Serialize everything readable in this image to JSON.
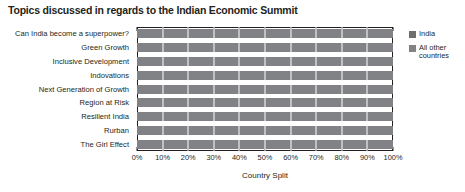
{
  "chart_data": {
    "type": "bar",
    "subtype": "stacked-horizontal-100-percent",
    "title": "Topics discussed in regards to the Indian Economic Summit",
    "xlabel": "Country Split",
    "ylabel": "",
    "xlim": [
      0,
      100
    ],
    "grid": true,
    "grid_axis": "x",
    "legend_position": "right",
    "orientation": "horizontal",
    "categories": [
      "Can India become a superpower?",
      "Green Growth",
      "Inclusive Development",
      "Indovations",
      "Next Generation of Growth",
      "Region at Risk",
      "Resilient India",
      "Rurban",
      "The Girl Effect"
    ],
    "xticks": [
      0,
      10,
      20,
      30,
      40,
      50,
      60,
      70,
      80,
      90,
      100
    ],
    "xticklabels": [
      "0%",
      "10%",
      "20%",
      "30%",
      "40%",
      "50%",
      "60%",
      "70%",
      "80%",
      "90%",
      "100%"
    ],
    "series": [
      {
        "name": "India",
        "color": "#6d6e70",
        "values": [
          0,
          0,
          0,
          0,
          0,
          0,
          0,
          0,
          0
        ]
      },
      {
        "name": "All other countries",
        "color": "#808285",
        "values": [
          100,
          100,
          100,
          100,
          100,
          100,
          100,
          100,
          100
        ]
      }
    ]
  },
  "legend": {
    "items": [
      {
        "label": "India",
        "color": "#6d6e70"
      },
      {
        "label": "All other countries",
        "color": "#808285"
      }
    ]
  },
  "colors": {
    "india": "#6d6e70",
    "all_other_countries": "#808285",
    "axis": "#231f20",
    "background": "#ffffff"
  }
}
